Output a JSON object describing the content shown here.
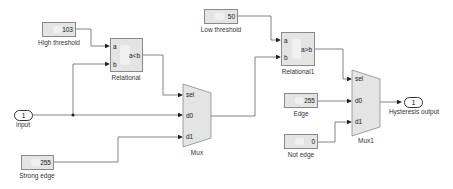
{
  "diagram": {
    "type": "simulink-model",
    "blocks": {
      "high_threshold": {
        "label": "High threshold",
        "value": "103"
      },
      "low_threshold": {
        "label": "Low threshold",
        "value": "50"
      },
      "relational": {
        "label": "Relational",
        "operator": "a<b",
        "port_a": "a",
        "port_b": "b"
      },
      "relational1": {
        "label": "Relational1",
        "operator": "a>b",
        "port_a": "a",
        "port_b": "b"
      },
      "input": {
        "label": "input",
        "number": "1"
      },
      "strong_edge": {
        "label": "Strong edge",
        "value": "255"
      },
      "mux": {
        "label": "Mux",
        "port_sel": "sel",
        "port_d0": "d0",
        "port_d1": "d1"
      },
      "edge": {
        "label": "Edge",
        "value": "255"
      },
      "not_edge": {
        "label": "Not edge",
        "value": "0"
      },
      "mux1": {
        "label": "Mux1",
        "port_sel": "sel",
        "port_d0": "d0",
        "port_d1": "d1"
      },
      "output": {
        "label": "Hysteresis output",
        "number": "1"
      }
    },
    "colors": {
      "block_fill": "#e4e4e4",
      "block_border": "#8a8a8a",
      "line": "#555555"
    }
  }
}
